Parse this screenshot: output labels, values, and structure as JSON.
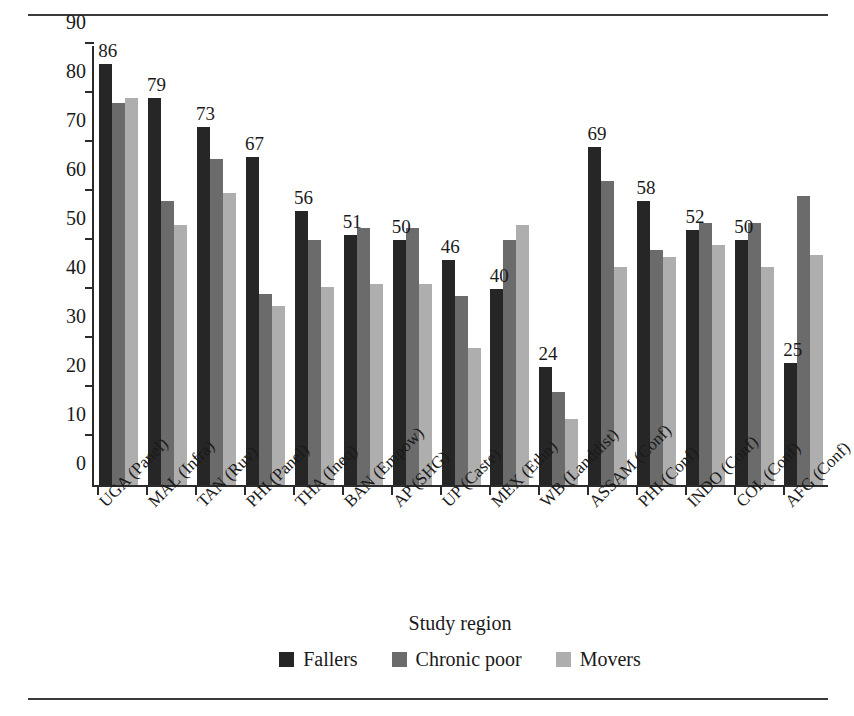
{
  "chart_data": {
    "type": "bar",
    "title": "",
    "xlabel": "Study region",
    "ylabel": "% households reporting health shock",
    "ylim": [
      0,
      90
    ],
    "yticks": [
      0,
      10,
      20,
      30,
      40,
      50,
      60,
      70,
      80,
      90
    ],
    "grid": false,
    "legend_position": "bottom-center",
    "categories": [
      "UGA (Panel)",
      "MAL (Infra)",
      "TAN (Ruv)",
      "PHI (Panel)",
      "THA (Ineq)",
      "BAN (Empow)",
      "AP (SHG)",
      "UP (Caste)",
      "MEX (Ethn)",
      "WB (Landdist)",
      "ASSAM (Conf)",
      "PHI (Conf)",
      "INDO (Conf)",
      "COL (Conf)",
      "AFG (Conf)"
    ],
    "series": [
      {
        "name": "Fallers",
        "color": "#262626",
        "values": [
          86,
          79,
          73,
          67,
          56,
          51,
          50,
          46,
          40,
          24,
          69,
          58,
          52,
          50,
          25
        ],
        "data_labels": [
          "86",
          "79",
          "73",
          "67",
          "56",
          "51",
          "50",
          "46",
          "40",
          "24",
          "69",
          "58",
          "52",
          "50",
          "25"
        ]
      },
      {
        "name": "Chronic poor",
        "color": "#6b6b6b",
        "values": [
          78,
          58,
          66.5,
          39,
          50,
          52.5,
          52.5,
          38.5,
          50,
          19,
          62,
          48,
          53.5,
          53.5,
          59
        ]
      },
      {
        "name": "Movers",
        "color": "#aeaeae",
        "values": [
          79,
          53,
          59.5,
          36.5,
          40.5,
          41,
          41,
          28,
          53,
          13.5,
          44.5,
          46.5,
          49,
          44.5,
          47
        ]
      }
    ]
  }
}
